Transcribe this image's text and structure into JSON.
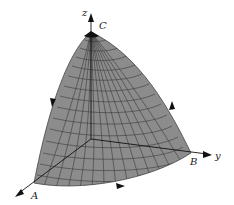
{
  "figure": {
    "axes": {
      "x_label": "x",
      "y_label": "y",
      "z_label": "z"
    },
    "points": {
      "A": {
        "label": "A"
      },
      "B": {
        "label": "B"
      },
      "C": {
        "label": "C"
      }
    },
    "colors": {
      "surface": "#8c8c8c",
      "grid": "#3a3a3a",
      "axis": "#111111",
      "background": "#ffffff"
    },
    "orientation_arrows": [
      "C-to-A (left edge, downward)",
      "A-to-B (bottom edge, rightward)",
      "B-to-C (right edge, upward)"
    ]
  }
}
